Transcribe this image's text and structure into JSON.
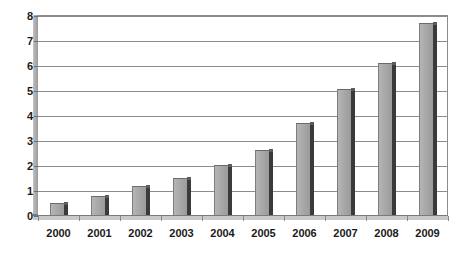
{
  "chart_data": {
    "type": "bar",
    "title": "",
    "subtitle": "",
    "xlabel": "",
    "ylabel": "",
    "categories": [
      "2000",
      "2001",
      "2002",
      "2003",
      "2004",
      "2005",
      "2006",
      "2007",
      "2008",
      "2009"
    ],
    "values": [
      0.5,
      0.75,
      1.15,
      1.5,
      2.0,
      2.6,
      3.7,
      5.05,
      6.1,
      7.7
    ],
    "series": [
      {
        "name": "",
        "values": [
          0.5,
          0.75,
          1.15,
          1.5,
          2.0,
          2.6,
          3.7,
          5.05,
          6.1,
          7.7
        ]
      }
    ],
    "ylim": [
      0,
      8
    ],
    "yticks": [
      0,
      1,
      2,
      3,
      4,
      5,
      6,
      7,
      8
    ],
    "ytick_labels": [
      "0",
      "1",
      "2",
      "3",
      "4",
      "5",
      "6",
      "7",
      "8"
    ],
    "grid": "horizontal",
    "legend": "none",
    "style": "3d-column",
    "colors": {
      "bar_face": "#a6a6a6",
      "bar_side": "#3a3a3a",
      "gridline": "#8c8c8c",
      "axis": "#6f6f6f",
      "text": "#1a1a1a",
      "background": "#ffffff"
    }
  }
}
